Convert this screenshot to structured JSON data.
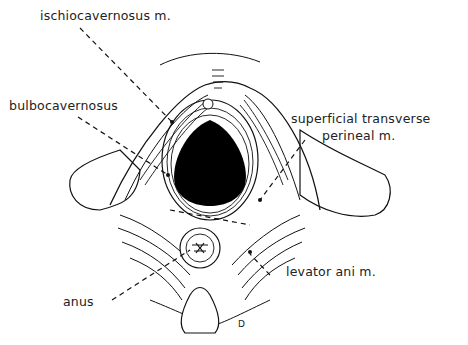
{
  "diagram": {
    "labels": {
      "ischiocavernosus": "ischiocavernosus m.",
      "bulbocavernosus": "bulbocavernosus",
      "superficial_transverse_1": "superficial transverse",
      "superficial_transverse_2": "perineal m.",
      "levator_ani": "levator ani m.",
      "anus": "anus"
    },
    "signature": "D"
  }
}
